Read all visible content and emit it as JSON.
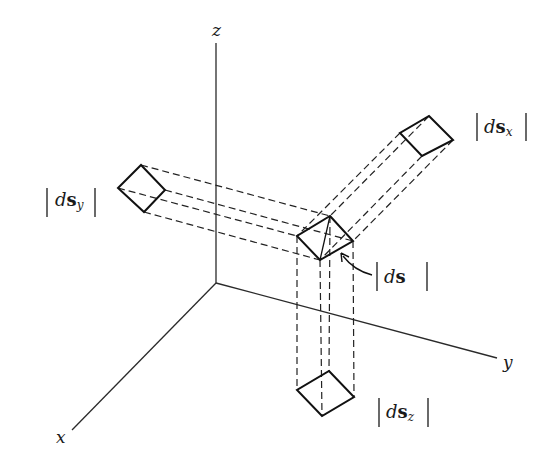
{
  "figure": {
    "type": "3d-axes-projection-diagram",
    "axes": {
      "x": {
        "label": "x"
      },
      "y": {
        "label": "y"
      },
      "z": {
        "label": "z"
      }
    },
    "elements": [
      {
        "id": "ds",
        "label_d": "d",
        "label_s": "s",
        "label_sub": "",
        "description": "line element magnitude"
      },
      {
        "id": "ds_x",
        "label_d": "d",
        "label_s": "s",
        "label_sub": "x",
        "description": "projection onto yz-plane"
      },
      {
        "id": "ds_y",
        "label_d": "d",
        "label_s": "s",
        "label_sub": "y",
        "description": "projection onto xz-plane"
      },
      {
        "id": "ds_z",
        "label_d": "d",
        "label_s": "s",
        "label_sub": "z",
        "description": "projection onto xy-plane"
      }
    ],
    "colors": {
      "ink": "#111111",
      "background": "#ffffff"
    }
  }
}
